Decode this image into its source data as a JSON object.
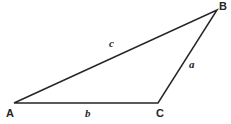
{
  "figure": {
    "kind": "geometry-diagram",
    "shape": "triangle",
    "background_color": "#ffffff",
    "stroke_color": "#262626",
    "stroke_width": 1.5,
    "width": 231,
    "height": 124
  },
  "vertices": [
    {
      "id": "A",
      "label": "A",
      "x": 14,
      "y": 103
    },
    {
      "id": "B",
      "label": "B",
      "x": 217,
      "y": 10
    },
    {
      "id": "C",
      "label": "C",
      "x": 158,
      "y": 103
    }
  ],
  "sides": [
    {
      "id": "a",
      "label": "a",
      "from": "C",
      "to": "B",
      "label_x": 192,
      "label_y": 65
    },
    {
      "id": "b",
      "label": "b",
      "from": "A",
      "to": "C",
      "label_x": 88,
      "label_y": 113
    },
    {
      "id": "c",
      "label": "c",
      "from": "A",
      "to": "B",
      "label_x": 112,
      "label_y": 44
    }
  ],
  "paths": {
    "triangle": "M 14 103 L 217 10 L 158 103 Z"
  }
}
